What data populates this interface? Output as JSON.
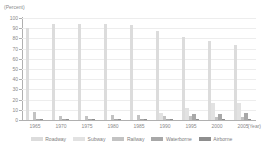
{
  "chart_data": {
    "type": "bar",
    "title": "",
    "subtitle": "",
    "xlabel": "(Year)",
    "ylabel": "(Percent)",
    "ylim": [
      0,
      100
    ],
    "yticks": [
      0,
      10,
      20,
      30,
      40,
      50,
      60,
      70,
      80,
      90,
      100
    ],
    "grid": true,
    "legend_position": "bottom",
    "categories": [
      "1965",
      "1970",
      "1975",
      "1980",
      "1985",
      "1990",
      "1995",
      "2000",
      "2005"
    ],
    "series": [
      {
        "name": "Roadway",
        "color": "#dcdcdc",
        "values": [
          90,
          94.5,
          94,
          93.8,
          92.8,
          87,
          81,
          77,
          74
        ]
      },
      {
        "name": "Subway",
        "color": "#e2e2e2",
        "values": [
          0,
          0,
          0,
          0,
          0,
          6.5,
          11.5,
          16.5,
          16.5
        ]
      },
      {
        "name": "Railway",
        "color": "#c3c3c3",
        "values": [
          8,
          3.5,
          3.5,
          4.5,
          5.2,
          3.8,
          4,
          3,
          3
        ]
      },
      {
        "name": "Waterborne",
        "color": "#a8a8a8",
        "values": [
          0.8,
          0.6,
          0.6,
          0.6,
          0.6,
          0.6,
          5.5,
          6,
          7
        ]
      },
      {
        "name": "Airborne",
        "color": "#8e8e8e",
        "values": [
          0.2,
          0.3,
          0.4,
          0.5,
          0.6,
          1.2,
          1.2,
          0.8,
          0.8
        ]
      }
    ]
  },
  "axes": {
    "y_unit": "(Percent)",
    "x_unit": "(Year)"
  }
}
